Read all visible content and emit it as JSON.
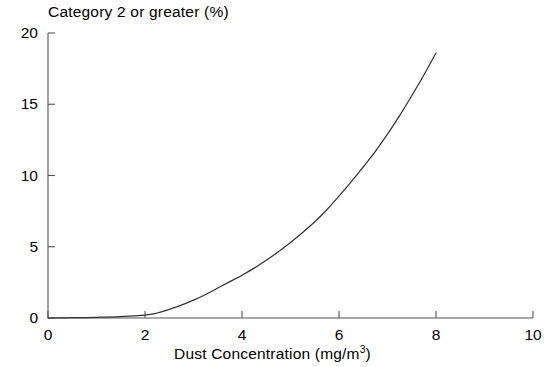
{
  "chart_data": {
    "type": "line",
    "title": "Category 2 or greater (%)",
    "xlabel_prefix": "Dust Concentration (mg/m",
    "xlabel_sup": "3",
    "xlabel_suffix": ")",
    "ylabel": "Category 2 or greater (%)",
    "xlim": [
      0,
      10
    ],
    "ylim": [
      0,
      20
    ],
    "grid": false,
    "legend": "none",
    "xticks": [
      "0",
      "2",
      "4",
      "6",
      "8",
      "10"
    ],
    "xtick_values": [
      0,
      2,
      4,
      6,
      8,
      10
    ],
    "yticks": [
      "0",
      "5",
      "10",
      "15",
      "20"
    ],
    "ytick_values": [
      0,
      5,
      10,
      15,
      20
    ],
    "line_color": "#333333",
    "axis_color": "#555555",
    "series": [
      {
        "name": "Category 2 or greater",
        "x": [
          0.0,
          0.5,
          1.0,
          1.5,
          2.0,
          2.25,
          2.5,
          2.75,
          3.0,
          3.25,
          3.5,
          3.75,
          4.0,
          4.25,
          4.5,
          4.75,
          5.0,
          5.25,
          5.5,
          5.75,
          6.0,
          6.25,
          6.5,
          6.75,
          7.0,
          7.25,
          7.5,
          7.75,
          8.0
        ],
        "y": [
          0.0,
          0.02,
          0.05,
          0.1,
          0.2,
          0.35,
          0.6,
          0.9,
          1.25,
          1.65,
          2.1,
          2.55,
          3.0,
          3.5,
          4.05,
          4.65,
          5.3,
          6.0,
          6.75,
          7.6,
          8.55,
          9.55,
          10.6,
          11.7,
          12.9,
          14.2,
          15.6,
          17.05,
          18.6
        ]
      }
    ]
  }
}
